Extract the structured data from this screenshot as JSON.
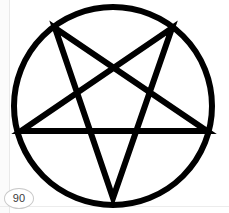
{
  "page": {
    "width": 229,
    "height": 213,
    "background_color": "#ffffff",
    "rule_color": "#e9e9e9"
  },
  "figure": {
    "name": "inverted-pentagram-in-circle",
    "stroke_color": "#000000",
    "fill_color": "none",
    "circle": {
      "cx": 113,
      "cy": 106,
      "r": 99,
      "stroke_width": 6
    },
    "pentagram": {
      "orientation": "point-down",
      "stroke_width": 6,
      "stroke_linejoin": "miter",
      "vertices": [
        {
          "name": "top-left",
          "x": 55,
          "y": 28
        },
        {
          "name": "top-right",
          "x": 172,
          "y": 28
        },
        {
          "name": "right",
          "x": 207,
          "y": 131
        },
        {
          "name": "bottom",
          "x": 113,
          "y": 198
        },
        {
          "name": "left",
          "x": 21,
          "y": 131
        }
      ],
      "path_order": [
        0,
        2,
        4,
        1,
        3,
        0
      ],
      "points_string": "55,28 207,131 21,131 172,28 113,198 55,28"
    }
  },
  "badge": {
    "label": "90",
    "text_color": "#3a3a3a",
    "border_color": "#c9c9c9",
    "background_color": "#ffffff"
  }
}
